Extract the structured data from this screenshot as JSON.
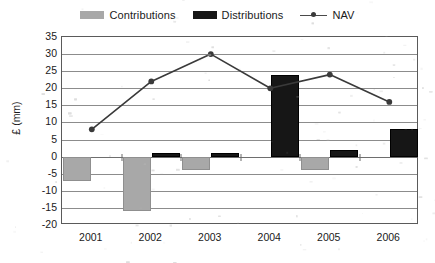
{
  "legend": {
    "items": [
      {
        "label": "Contributions",
        "marker": "gray-square-swatch",
        "color": "#a8a8a8"
      },
      {
        "label": "Distributions",
        "marker": "black-square-swatch",
        "color": "#161616"
      },
      {
        "label": "NAV",
        "marker": "line-with-round-marker",
        "color": "#3a3a3a"
      }
    ]
  },
  "chart_data": {
    "type": "bar",
    "title": "",
    "subtitle": "",
    "xlabel": "",
    "ylabel": "£ (mm)",
    "categories": [
      "2001",
      "2002",
      "2003",
      "2004",
      "2005",
      "2006"
    ],
    "ylim": [
      -20,
      35
    ],
    "ytick_step": 5,
    "yticks": [
      35,
      30,
      25,
      20,
      15,
      10,
      5,
      0,
      -5,
      -10,
      -15,
      -20
    ],
    "ytick_labels": [
      "35",
      "30",
      "25",
      "20",
      "15",
      "10",
      "5",
      "0",
      "-5",
      "-10",
      "-15",
      "-20"
    ],
    "grid": true,
    "grid_axis": "y",
    "legend_position": "top-center",
    "series": [
      {
        "name": "Contributions",
        "type": "bar",
        "color": "#a8a8a8",
        "values": [
          -7,
          -16,
          -4,
          0,
          -4,
          0
        ]
      },
      {
        "name": "Distributions",
        "type": "bar",
        "color": "#161616",
        "values": [
          0,
          1,
          1,
          24,
          2,
          8
        ]
      },
      {
        "name": "NAV",
        "type": "line",
        "color": "#3a3a3a",
        "marker": "circle",
        "values": [
          8,
          22,
          30,
          20,
          24,
          16
        ]
      }
    ]
  }
}
